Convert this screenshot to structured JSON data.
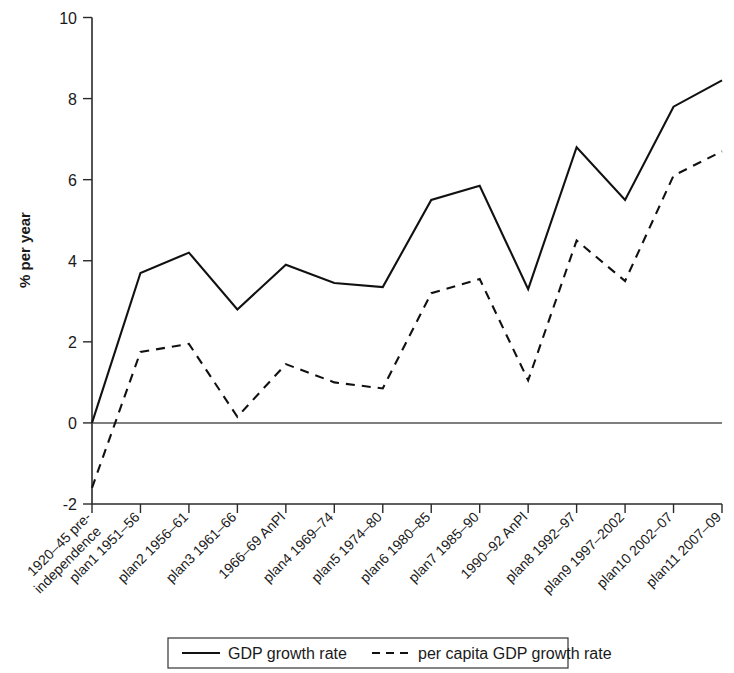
{
  "chart_data": {
    "type": "line",
    "title": "",
    "xlabel": "",
    "ylabel": "% per year",
    "ylim": [
      -2,
      10
    ],
    "yticks": [
      -2,
      0,
      2,
      4,
      6,
      8,
      10
    ],
    "ytick_labels": [
      "-2",
      "0",
      "2",
      "4",
      "6",
      "8",
      "10"
    ],
    "grid": false,
    "legend_position": "bottom",
    "categories": [
      "1920–45 pre-independence",
      "plan1 1951–56",
      "plan2 1956–61",
      "plan3 1961–66",
      "1966–69 AnPl",
      "plan4 1969–74",
      "plan5 1974–80",
      "plan6 1980–85",
      "plan7 1985–90",
      "1990–92 AnPl",
      "plan8 1992–97",
      "plan9 1997–2002",
      "plan10 2002–07",
      "plan11 2007–09"
    ],
    "series": [
      {
        "name": "GDP growth rate",
        "style": "solid",
        "values": [
          0.0,
          3.7,
          4.2,
          2.8,
          3.9,
          3.45,
          3.35,
          5.5,
          5.85,
          3.3,
          6.8,
          5.5,
          7.8,
          8.45
        ]
      },
      {
        "name": "per capita GDP growth rate",
        "style": "dashed",
        "values": [
          -1.6,
          1.75,
          1.95,
          0.15,
          1.45,
          1.0,
          0.85,
          3.2,
          3.55,
          1.05,
          4.5,
          3.5,
          6.1,
          6.7
        ]
      }
    ]
  },
  "legend": {
    "entries": [
      {
        "label": "GDP growth rate",
        "style": "solid"
      },
      {
        "label": "per capita GDP growth rate",
        "style": "dashed"
      }
    ]
  },
  "colors": {
    "line": "#111111",
    "axis": "#2a2a2a",
    "background": "#ffffff"
  }
}
